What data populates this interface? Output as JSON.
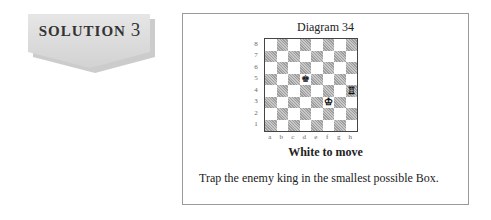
{
  "badge": {
    "word": "SOLUTION",
    "number": "3"
  },
  "diagram": {
    "title": "Diagram 34",
    "ranks": [
      "8",
      "7",
      "6",
      "5",
      "4",
      "3",
      "2",
      "1"
    ],
    "files": [
      "a",
      "b",
      "c",
      "d",
      "e",
      "f",
      "g",
      "h"
    ],
    "pieces": [
      {
        "square": "d5",
        "glyph": "♚",
        "color": "black",
        "name": "black-king"
      },
      {
        "square": "f3",
        "glyph": "♔",
        "color": "white",
        "name": "white-king"
      },
      {
        "square": "h4",
        "glyph": "♖",
        "color": "white",
        "name": "white-rook"
      }
    ],
    "to_move": "White to move",
    "task": "Trap the enemy king in the smallest possible Box."
  }
}
